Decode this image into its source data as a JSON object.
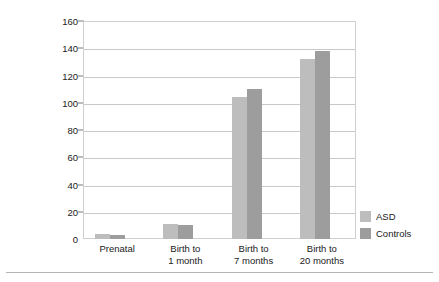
{
  "chart_data": {
    "type": "bar",
    "title": "",
    "xlabel": "",
    "ylabel": "Amount of cumulative exposure to thimerosal in vaccinations",
    "ylabel_line1": "Amount of cumulative exposure",
    "ylabel_line2": "to thimerosal in vaccinations",
    "categories": [
      "Prenatal",
      "Birth to 1 month",
      "Birth to 7 months",
      "Birth to 20 months"
    ],
    "category_lines": [
      [
        "Prenatal",
        ""
      ],
      [
        "Birth to",
        "1 month"
      ],
      [
        "Birth to",
        "7 months"
      ],
      [
        "Birth to",
        "20 months"
      ]
    ],
    "series": [
      {
        "name": "ASD",
        "color": "#bdbdbd",
        "values": [
          4,
          11,
          104,
          132
        ]
      },
      {
        "name": "Controls",
        "color": "#9d9d9d",
        "values": [
          3,
          10,
          110,
          138
        ]
      }
    ],
    "ylim": [
      0,
      160
    ],
    "yticks": [
      0,
      20,
      40,
      60,
      80,
      100,
      120,
      140,
      160
    ],
    "ytick_labels": [
      "0",
      "20",
      "40",
      "60",
      "80",
      "100",
      "120",
      "140",
      "160"
    ],
    "grid": true,
    "legend_position": "right"
  },
  "legend": {
    "entries": [
      {
        "label": "ASD",
        "color": "#bdbdbd"
      },
      {
        "label": "Controls",
        "color": "#9d9d9d"
      }
    ]
  }
}
